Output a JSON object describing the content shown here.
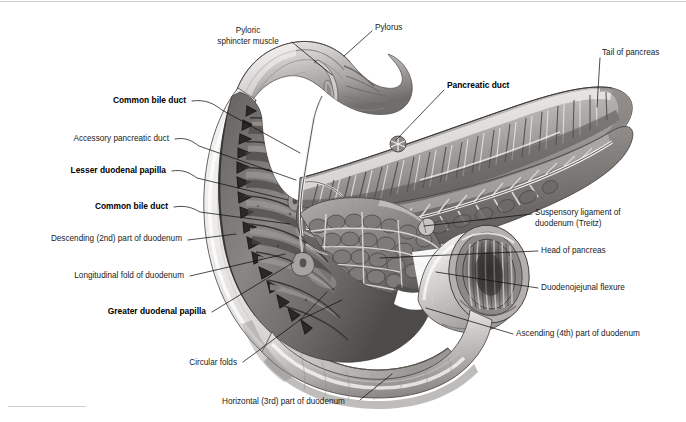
{
  "figure": {
    "kind": "anatomical-illustration",
    "medium": "grayscale pencil/airbrush medical illustration",
    "background_color": "#ffffff",
    "frame": {
      "top_rule": true,
      "bottom_left_rule": true,
      "rule_color": "#cfcfd2"
    }
  },
  "labels": [
    {
      "id": "pyloric-sphincter-muscle",
      "lines": [
        "Pyloric",
        "sphincter muscle"
      ],
      "bold": false,
      "text_anchor": "middle",
      "x": 248,
      "y": 33,
      "line_height": 11,
      "leader": "M 292 42 L 332 75",
      "side": "top-left"
    },
    {
      "id": "pylorus",
      "lines": [
        "Pylorus"
      ],
      "bold": false,
      "text_anchor": "start",
      "x": 375,
      "y": 30,
      "line_height": 11,
      "leader": "M 372 31 L 344 56",
      "side": "top-right"
    },
    {
      "id": "tail-of-pancreas",
      "lines": [
        "Tail of pancreas"
      ],
      "bold": false,
      "text_anchor": "start",
      "x": 602,
      "y": 55,
      "line_height": 11,
      "leader": "M 600 58 L 597 107",
      "side": "right"
    },
    {
      "id": "pancreatic-duct",
      "lines": [
        "Pancreatic duct"
      ],
      "bold": true,
      "text_anchor": "start",
      "x": 447,
      "y": 88,
      "line_height": 11,
      "leader": "M 444 90 L 396 140",
      "side": "right"
    },
    {
      "id": "common-bile-duct-upper",
      "lines": [
        "Common bile duct"
      ],
      "bold": true,
      "text_anchor": "end",
      "x": 186,
      "y": 103,
      "line_height": 11,
      "leader": "M 192 101 C 206 99 214 104 222 110 L 300 153",
      "side": "left"
    },
    {
      "id": "accessory-pancreatic-duct",
      "lines": [
        "Accessory pancreatic duct"
      ],
      "bold": false,
      "text_anchor": "end",
      "x": 169,
      "y": 141,
      "line_height": 11,
      "leader": "M 175 139 C 186 137 192 141 199 146 L 296 180",
      "side": "left"
    },
    {
      "id": "lesser-duodenal-papilla",
      "lines": [
        "Lesser duodenal papilla"
      ],
      "bold": true,
      "text_anchor": "end",
      "x": 166,
      "y": 173,
      "line_height": 11,
      "leader": "M 172 171 C 183 169 190 173 197 178 L 288 200",
      "side": "left"
    },
    {
      "id": "common-bile-duct-lower",
      "lines": [
        "Common bile duct"
      ],
      "bold": true,
      "text_anchor": "end",
      "x": 168,
      "y": 209,
      "line_height": 11,
      "leader": "M 174 207 C 186 205 193 208 200 212 L 290 224",
      "side": "left"
    },
    {
      "id": "descending-second-part-of-duodenum",
      "lines": [
        "Descending (2nd) part of duodenum"
      ],
      "bold": false,
      "text_anchor": "end",
      "x": 182,
      "y": 241,
      "line_height": 11,
      "leader": "M 188 240 L 236 234",
      "side": "left"
    },
    {
      "id": "longitudinal-fold-of-duodenum",
      "lines": [
        "Longitudinal fold of duodenum"
      ],
      "bold": false,
      "text_anchor": "end",
      "x": 184,
      "y": 278,
      "line_height": 11,
      "leader": "M 190 276 L 285 254",
      "side": "left"
    },
    {
      "id": "greater-duodenal-papilla",
      "lines": [
        "Greater duodenal papilla"
      ],
      "bold": true,
      "text_anchor": "end",
      "x": 206,
      "y": 314,
      "line_height": 11,
      "leader": "M 212 312 L 294 262",
      "side": "left"
    },
    {
      "id": "circular-folds",
      "lines": [
        "Circular folds"
      ],
      "bold": false,
      "text_anchor": "end",
      "x": 237,
      "y": 365,
      "line_height": 11,
      "leader": "M 243 362 L 300 320 M 300 320 L 327 292 M 300 320 L 342 300",
      "side": "left"
    },
    {
      "id": "horizontal-third-part-of-duodenum",
      "lines": [
        "Horizontal (3rd) part of duodenum"
      ],
      "bold": false,
      "text_anchor": "start",
      "x": 222,
      "y": 404,
      "line_height": 11,
      "leader": "M 360 400 L 392 374",
      "side": "bottom"
    },
    {
      "id": "suspensory-ligament-of-duodenum-treitz",
      "lines": [
        "Suspensory ligament of",
        "duodenum (Treitz)"
      ],
      "bold": false,
      "text_anchor": "start",
      "x": 535,
      "y": 215,
      "line_height": 11,
      "leader": "M 532 214 L 424 226",
      "side": "right"
    },
    {
      "id": "head-of-pancreas",
      "lines": [
        "Head of pancreas"
      ],
      "bold": false,
      "text_anchor": "start",
      "x": 541,
      "y": 253,
      "line_height": 11,
      "leader": "M 538 251 L 380 258",
      "side": "right"
    },
    {
      "id": "duodenojejunal-flexure",
      "lines": [
        "Duodenojejunal flexure"
      ],
      "bold": false,
      "text_anchor": "start",
      "x": 541,
      "y": 290,
      "line_height": 11,
      "leader": "M 538 288 L 436 272",
      "side": "right"
    },
    {
      "id": "ascending-fourth-part-of-duodenum",
      "lines": [
        "Ascending (4th) part of duodenum"
      ],
      "bold": false,
      "text_anchor": "start",
      "x": 516,
      "y": 336,
      "line_height": 11,
      "leader": "M 513 334 L 426 308",
      "side": "right"
    }
  ],
  "structures": [
    {
      "id": "stomach-pylorus",
      "name": "Pylorus / pyloric canal of stomach"
    },
    {
      "id": "duodenum-descending",
      "name": "Descending (2nd) part of duodenum, opened"
    },
    {
      "id": "duodenum-horizontal",
      "name": "Horizontal (3rd) part of duodenum"
    },
    {
      "id": "duodenum-ascending",
      "name": "Ascending (4th) part of duodenum"
    },
    {
      "id": "pancreas-body-tail",
      "name": "Body and tail of pancreas, sectioned"
    },
    {
      "id": "pancreas-head",
      "name": "Head of pancreas"
    },
    {
      "id": "jejunum-cut-end",
      "name": "Cut end of jejunum at duodenojejunal flexure"
    },
    {
      "id": "mucosa-circular-folds",
      "name": "Circular folds (plicae circulares) of duodenal mucosa"
    },
    {
      "id": "duct-system",
      "name": "Pancreatic, accessory pancreatic and common bile ducts"
    }
  ],
  "palette": {
    "paper": "#ffffff",
    "ink": "#1a1a1a",
    "leader": "#111111",
    "tissue_light": "#e6e4e2",
    "tissue_mid": "#b9b6b4",
    "tissue_dark": "#6f6c6b",
    "tissue_darkest": "#3b3937",
    "serosa_highlight": "#f3f2f1",
    "rule": "#cfcfd2"
  }
}
